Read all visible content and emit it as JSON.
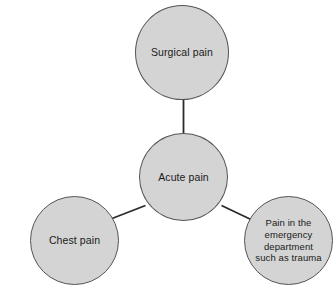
{
  "diagram": {
    "type": "hub-and-spoke",
    "orientation": "radial",
    "background_color": "#ffffff",
    "node_fill_color": "#d4d4d4",
    "node_border_color": "#555555",
    "text_color": "#1a1a1a",
    "edge_color": "#2a2a2a",
    "center_node_id": "acute-pain",
    "nodes": [
      {
        "id": "surgical-pain",
        "label": "Surgical pain",
        "role": "spoke",
        "position": "top"
      },
      {
        "id": "acute-pain",
        "label": "Acute pain",
        "role": "hub",
        "position": "center"
      },
      {
        "id": "chest-pain",
        "label": "Chest pain",
        "role": "spoke",
        "position": "bottom-left"
      },
      {
        "id": "emergency-pain",
        "label": "Pain in the\nemergency\ndepartment\nsuch as trauma",
        "role": "spoke",
        "position": "bottom-right"
      }
    ],
    "edges": [
      {
        "id": "edge-acute-surgical",
        "from": "acute-pain",
        "to": "surgical-pain"
      },
      {
        "id": "edge-acute-chest",
        "from": "acute-pain",
        "to": "chest-pain"
      },
      {
        "id": "edge-acute-emergency",
        "from": "acute-pain",
        "to": "emergency-pain"
      }
    ]
  }
}
